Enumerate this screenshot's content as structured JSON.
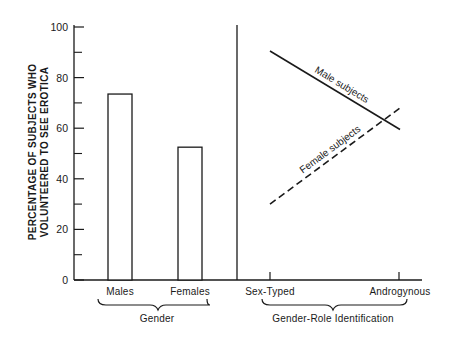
{
  "chart_data": {
    "type": "bar+line",
    "ylabel_lines": [
      "PERCENTAGE OF SUBJECTS WHO",
      "VOLUNTEERED TO SEE EROTICA"
    ],
    "ylim": [
      0,
      100
    ],
    "yticks": [
      0,
      20,
      40,
      60,
      80,
      100
    ],
    "yticks_minor": [
      10,
      30,
      50,
      70,
      90
    ],
    "grid": false,
    "panels": [
      {
        "type": "bar",
        "group_label": "Gender",
        "categories": [
          "Males",
          "Females"
        ],
        "values": [
          73.5,
          52.5
        ]
      },
      {
        "type": "line",
        "group_label": "Gender-Role Identification",
        "categories": [
          "Sex-Typed",
          "Androgynous"
        ],
        "series": [
          {
            "name": "Male subjects",
            "style": "solid",
            "values": [
              90.5,
              59.5
            ]
          },
          {
            "name": "Female subjects",
            "style": "dashed",
            "values": [
              30,
              68
            ]
          }
        ]
      }
    ]
  }
}
